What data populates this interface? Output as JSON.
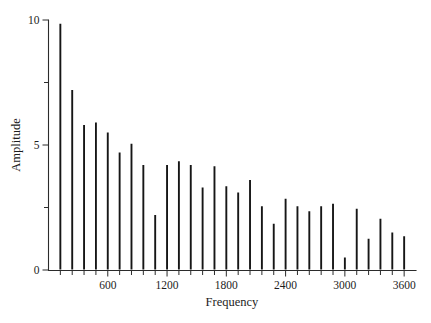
{
  "chart_data": {
    "type": "bar",
    "title": "",
    "subtitle": "",
    "xlabel": "Frequency",
    "ylabel": "Amplitude",
    "xlim": [
      0,
      3720
    ],
    "ylim": [
      0,
      10
    ],
    "grid": false,
    "legend": null,
    "x_tick_labels": [
      "600",
      "1200",
      "1800",
      "2400",
      "3000",
      "3600"
    ],
    "x_tick_values": [
      600,
      1200,
      1800,
      2400,
      3000,
      3600
    ],
    "x_minor_tick_step": 120,
    "y_tick_labels": [
      "0",
      "5",
      "10"
    ],
    "y_tick_values": [
      0,
      5,
      10
    ],
    "y_minor_tick_values": [
      2.5,
      7.5
    ],
    "bar_style": "stem",
    "x": [
      120,
      240,
      360,
      480,
      600,
      720,
      840,
      960,
      1080,
      1200,
      1320,
      1440,
      1560,
      1680,
      1800,
      1920,
      2040,
      2160,
      2280,
      2400,
      2520,
      2640,
      2760,
      2880,
      3000,
      3120,
      3240,
      3360,
      3480,
      3600
    ],
    "values": [
      9.85,
      7.2,
      5.8,
      5.9,
      5.5,
      4.7,
      5.05,
      4.2,
      2.2,
      4.2,
      4.35,
      4.2,
      3.3,
      4.15,
      3.35,
      3.1,
      3.6,
      2.55,
      1.85,
      2.85,
      2.55,
      2.35,
      2.55,
      2.65,
      0.5,
      2.45,
      1.25,
      2.05,
      1.5,
      1.35
    ],
    "series": [
      {
        "name": "Amplitude spectrum",
        "color": "#161616",
        "values": [
          9.85,
          7.2,
          5.8,
          5.9,
          5.5,
          4.7,
          5.05,
          4.2,
          2.2,
          4.2,
          4.35,
          4.2,
          3.3,
          4.15,
          3.35,
          3.1,
          3.6,
          2.55,
          1.85,
          2.85,
          2.55,
          2.35,
          2.55,
          2.65,
          0.5,
          2.45,
          1.25,
          2.05,
          1.5,
          1.35
        ]
      }
    ]
  },
  "axes": {
    "x_title": "Frequency",
    "y_title": "Amplitude"
  }
}
